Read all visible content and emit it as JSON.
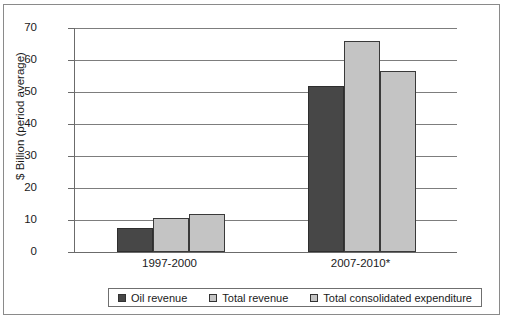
{
  "chart_data": {
    "type": "bar",
    "title": "",
    "xlabel": "",
    "ylabel": "$ Billion (period average)",
    "categories": [
      "1997-2000",
      "2007-2010*"
    ],
    "series": [
      {
        "name": "Oil revenue",
        "values": [
          7.5,
          52.0
        ],
        "color": "#474747"
      },
      {
        "name": "Total revenue",
        "values": [
          10.5,
          66.0
        ],
        "color": "#c4c4c4"
      },
      {
        "name": "Total consolidated expenditure",
        "values": [
          11.8,
          56.5
        ],
        "color": "#c4c4c4"
      }
    ],
    "ylim": [
      0,
      70
    ],
    "yticks": [
      0,
      10,
      20,
      30,
      40,
      50,
      60,
      70
    ],
    "ytick_labels": [
      "0",
      "10",
      "20",
      "30",
      "40",
      "50",
      "60",
      "70"
    ],
    "grid": true,
    "legend_position": "bottom"
  },
  "legend": {
    "items": [
      {
        "label": "Oil revenue",
        "swatch": "dark"
      },
      {
        "label": "Total revenue",
        "swatch": "light"
      },
      {
        "label": "Total consolidated expenditure",
        "swatch": "light"
      }
    ]
  },
  "footnote": {
    "text": ""
  }
}
